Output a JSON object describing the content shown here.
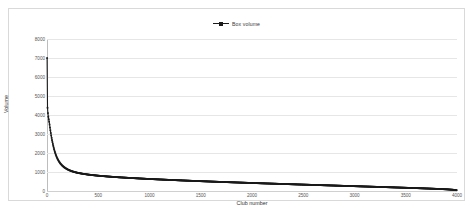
{
  "chart_data": {
    "type": "scatter",
    "title": "",
    "xlabel": "Club number",
    "ylabel": "Volume",
    "xlim": [
      0,
      4000
    ],
    "ylim": [
      0,
      8000
    ],
    "grid": true,
    "legend_position": "top-center",
    "series": [
      {
        "name": "Box volume",
        "color": "#1a1a1a",
        "marker": "square",
        "description": "Rank-ordered box volume per club: steep power-law decay from ~7000 at rank 1, flattening near rank 200, long slowly-declining tail to ~40 at rank 4000.",
        "points": [
          [
            1,
            7000
          ],
          [
            2,
            5150
          ],
          [
            3,
            4700
          ],
          [
            4,
            4500
          ],
          [
            5,
            4380
          ],
          [
            8,
            4150
          ],
          [
            12,
            3950
          ],
          [
            16,
            3800
          ],
          [
            20,
            3680
          ],
          [
            25,
            3500
          ],
          [
            30,
            3300
          ],
          [
            35,
            3120
          ],
          [
            40,
            2950
          ],
          [
            45,
            2800
          ],
          [
            50,
            2650
          ],
          [
            60,
            2400
          ],
          [
            70,
            2180
          ],
          [
            80,
            2000
          ],
          [
            90,
            1850
          ],
          [
            100,
            1720
          ],
          [
            115,
            1570
          ],
          [
            130,
            1450
          ],
          [
            150,
            1330
          ],
          [
            170,
            1240
          ],
          [
            190,
            1170
          ],
          [
            210,
            1110
          ],
          [
            240,
            1045
          ],
          [
            270,
            995
          ],
          [
            300,
            955
          ],
          [
            350,
            905
          ],
          [
            400,
            865
          ],
          [
            450,
            833
          ],
          [
            500,
            805
          ],
          [
            600,
            760
          ],
          [
            700,
            722
          ],
          [
            800,
            690
          ],
          [
            900,
            660
          ],
          [
            1000,
            632
          ],
          [
            1100,
            607
          ],
          [
            1200,
            583
          ],
          [
            1300,
            560
          ],
          [
            1400,
            538
          ],
          [
            1500,
            517
          ],
          [
            1600,
            497
          ],
          [
            1700,
            477
          ],
          [
            1800,
            458
          ],
          [
            1900,
            440
          ],
          [
            2000,
            422
          ],
          [
            2100,
            404
          ],
          [
            2200,
            387
          ],
          [
            2300,
            370
          ],
          [
            2400,
            353
          ],
          [
            2500,
            336
          ],
          [
            2600,
            320
          ],
          [
            2700,
            303
          ],
          [
            2800,
            287
          ],
          [
            2900,
            270
          ],
          [
            3000,
            254
          ],
          [
            3100,
            237
          ],
          [
            3200,
            221
          ],
          [
            3300,
            204
          ],
          [
            3400,
            187
          ],
          [
            3500,
            170
          ],
          [
            3600,
            152
          ],
          [
            3700,
            133
          ],
          [
            3800,
            113
          ],
          [
            3900,
            88
          ],
          [
            3960,
            65
          ],
          [
            4000,
            40
          ]
        ]
      }
    ],
    "y_ticks": [
      0,
      1000,
      2000,
      3000,
      4000,
      5000,
      6000,
      7000,
      8000
    ],
    "x_ticks": [
      0,
      500,
      1000,
      1500,
      2000,
      2500,
      3000,
      3500,
      4000
    ]
  },
  "legend": {
    "entries": [
      {
        "label": "Box volume",
        "symbol": "line-with-square-marker"
      }
    ]
  },
  "colors": {
    "series": "#1a1a1a",
    "gridline": "#e6e6e6",
    "border": "#d9d9d9",
    "tick_text": "#555555",
    "background": "#ffffff"
  }
}
